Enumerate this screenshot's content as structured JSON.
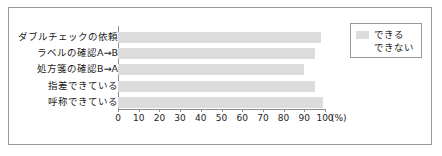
{
  "chart_data": {
    "type": "bar",
    "orientation": "horizontal",
    "title": "",
    "subtitle": "",
    "xlabel": "(%)",
    "ylabel": "",
    "categories": [
      "ダブルチェックの依頼",
      "ラベルの確認A→B",
      "処方箋の確認B→A",
      "指差できている",
      "呼称できている"
    ],
    "series": [
      {
        "name": "できる",
        "color": "#dcdcdc",
        "values": [
          98,
          95,
          90,
          95,
          99
        ]
      },
      {
        "name": "できない",
        "color": "#ffffff",
        "values": [
          2,
          5,
          10,
          5,
          1
        ]
      }
    ],
    "xlim": [
      0,
      100
    ],
    "xticks": [
      0,
      10,
      20,
      30,
      40,
      50,
      60,
      70,
      80,
      90,
      100
    ],
    "xtick_labels": [
      "0",
      "10",
      "20",
      "30",
      "40",
      "50",
      "60",
      "70",
      "80",
      "90",
      "100"
    ],
    "unit": "(%)",
    "grid": false,
    "legend": {
      "position": "top-right",
      "entries": [
        {
          "label": "できる",
          "color": "#dcdcdc"
        },
        {
          "label": "できない",
          "color": "#ffffff"
        }
      ]
    }
  },
  "panel": {
    "border_color": "#9a9a9a",
    "background": "#ffffff"
  }
}
